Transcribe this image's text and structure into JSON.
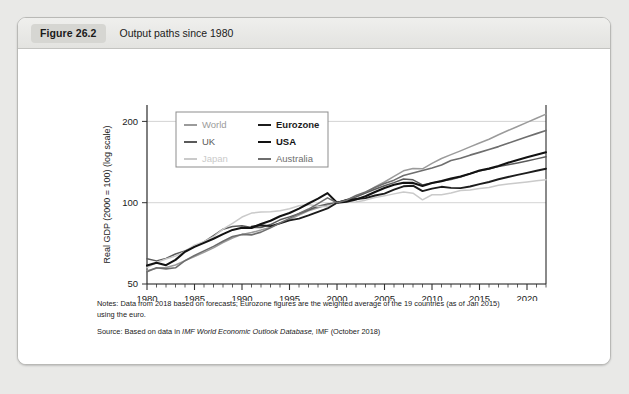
{
  "figure": {
    "badge": "Figure 26.2",
    "caption": "Output paths since 1980"
  },
  "notes": {
    "notes_label": "Notes:",
    "notes_text_1": " Data from 2018 based on forecasts; Eurozone figures are the weighted average of the 19 countries (as of Jan 2015)",
    "notes_text_2": "using the euro.",
    "source_label": "Source:",
    "source_text_pre": " Based on data in ",
    "source_italic": "IMF World Economic Outlook Database,",
    "source_text_post": " IMF (October 2018)"
  },
  "chart_data": {
    "type": "line",
    "title": "Output paths since 1980",
    "xlabel": "",
    "ylabel": "Real GDP (2000 = 100) (log scale)",
    "yscale": "log",
    "ylim": [
      50,
      230
    ],
    "xlim": [
      1980,
      2022
    ],
    "yticks": [
      50,
      100,
      200
    ],
    "ytick_labels": [
      "50",
      "100",
      "200"
    ],
    "xticks": [
      1980,
      1985,
      1990,
      1995,
      2000,
      2005,
      2010,
      2015,
      2020
    ],
    "xtick_labels": [
      "1980",
      "1985",
      "1990",
      "1995",
      "2000",
      "2005",
      "2010",
      "2015",
      "2020"
    ],
    "xtick_minor_step": 1,
    "grid": true,
    "grid_axis": "y",
    "legend_position": "top-left-inside",
    "legend_columns": 2,
    "x": [
      1980,
      1981,
      1982,
      1983,
      1984,
      1985,
      1986,
      1987,
      1988,
      1989,
      1990,
      1991,
      1992,
      1993,
      1994,
      1995,
      1996,
      1997,
      1998,
      1999,
      2000,
      2001,
      2002,
      2003,
      2004,
      2005,
      2006,
      2007,
      2008,
      2009,
      2010,
      2011,
      2012,
      2013,
      2014,
      2015,
      2016,
      2017,
      2018,
      2019,
      2020,
      2021,
      2022
    ],
    "series": [
      {
        "name": "World",
        "color": "#9b9b9b",
        "width": 1.5,
        "values": [
          56.0,
          57.2,
          57.6,
          58.8,
          61.0,
          63.2,
          65.5,
          68.0,
          71.1,
          74.0,
          76.3,
          77.5,
          79.2,
          81.2,
          84.0,
          86.6,
          89.9,
          93.4,
          95.8,
          98.2,
          100.0,
          102.0,
          104.9,
          109.0,
          114.3,
          119.3,
          125.2,
          131.2,
          133.8,
          133.5,
          139.9,
          145.8,
          150.6,
          155.5,
          160.9,
          166.3,
          171.8,
          178.5,
          185.0,
          191.5,
          198.3,
          205.4,
          212.8
        ]
      },
      {
        "name": "UK",
        "color": "#5a5a5a",
        "width": 1.5,
        "values": [
          62.0,
          60.9,
          62.2,
          64.6,
          66.3,
          68.9,
          71.6,
          75.6,
          79.8,
          81.6,
          82.2,
          81.0,
          81.0,
          83.0,
          86.4,
          88.6,
          91.0,
          94.0,
          97.0,
          99.0,
          100.0,
          102.6,
          105.1,
          108.6,
          112.1,
          115.6,
          118.7,
          122.4,
          121.5,
          116.4,
          118.4,
          120.2,
          121.9,
          124.5,
          128.1,
          131.0,
          133.4,
          136.0,
          138.1,
          140.4,
          142.8,
          145.3,
          147.9
        ]
      },
      {
        "name": "Japan",
        "color": "#cacaca",
        "width": 1.5,
        "values": [
          57.5,
          60.0,
          61.9,
          63.4,
          66.0,
          69.6,
          71.7,
          74.8,
          79.8,
          83.8,
          88.5,
          91.5,
          92.3,
          92.5,
          93.4,
          95.0,
          97.5,
          98.5,
          97.0,
          96.7,
          100.0,
          100.4,
          100.6,
          102.2,
          104.5,
          106.0,
          107.8,
          109.6,
          108.4,
          102.5,
          107.0,
          107.1,
          108.7,
          111.0,
          111.4,
          112.8,
          113.8,
          116.0,
          117.2,
          118.3,
          119.4,
          120.6,
          121.7
        ]
      },
      {
        "name": "Eurozone",
        "color": "#1c1c1c",
        "width": 1.9,
        "values": [
          null,
          null,
          null,
          null,
          null,
          null,
          null,
          null,
          null,
          null,
          null,
          81.5,
          82.5,
          81.9,
          83.8,
          86.0,
          87.3,
          89.7,
          92.4,
          95.2,
          100.0,
          102.2,
          103.2,
          104.0,
          106.3,
          108.1,
          111.7,
          115.0,
          115.6,
          110.4,
          112.7,
          114.5,
          113.5,
          113.2,
          114.8,
          117.1,
          119.3,
          122.1,
          124.5,
          126.7,
          129.0,
          131.3,
          133.6
        ]
      },
      {
        "name": "USA",
        "color": "#121212",
        "width": 2.1,
        "values": [
          58.5,
          59.9,
          58.7,
          61.4,
          65.8,
          68.6,
          71.0,
          73.5,
          76.5,
          79.3,
          80.8,
          80.6,
          83.4,
          85.7,
          89.1,
          91.6,
          95.1,
          99.3,
          103.5,
          108.5,
          100.0,
          100.9,
          102.7,
          105.6,
          109.6,
          113.4,
          116.5,
          118.6,
          118.4,
          115.4,
          118.3,
          120.2,
          122.9,
          125.0,
          128.1,
          131.6,
          133.7,
          136.8,
          140.5,
          144.0,
          147.2,
          150.5,
          153.8
        ]
      },
      {
        "name": "Australia",
        "color": "#6e6e6e",
        "width": 1.6,
        "values": [
          55.5,
          57.4,
          56.9,
          57.4,
          61.0,
          63.8,
          66.3,
          68.9,
          72.0,
          75.0,
          76.3,
          76.0,
          77.8,
          80.7,
          84.1,
          87.5,
          91.2,
          94.7,
          99.2,
          104.2,
          100.0,
          102.1,
          106.3,
          109.5,
          113.8,
          117.7,
          121.2,
          126.0,
          128.8,
          131.5,
          134.5,
          138.0,
          143.3,
          146.1,
          150.0,
          153.6,
          157.5,
          161.3,
          166.0,
          170.6,
          175.3,
          180.2,
          185.2
        ]
      }
    ]
  }
}
